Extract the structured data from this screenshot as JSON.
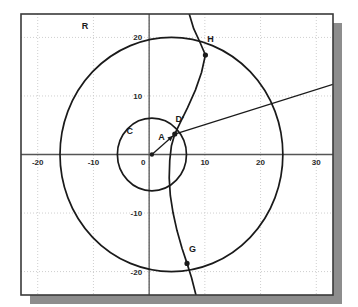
{
  "figure": {
    "background_color": "#ffffff",
    "frame_color": "#3a3a3a",
    "shadow_color": "#8d8d8d",
    "grid_color": "#cfcfcf",
    "axis_color": "#555555",
    "curve_color": "#1a1a1a"
  },
  "chart_data": {
    "type": "scatter",
    "title": "",
    "xlabel": "",
    "ylabel": "",
    "xlim": [
      -23,
      33
    ],
    "ylim": [
      -24,
      24
    ],
    "grid": true,
    "legend": "none",
    "x_ticks": [
      -20,
      -10,
      0,
      10,
      20,
      30
    ],
    "x_tick_labels": [
      "-20",
      "-10",
      "0",
      "10",
      "20",
      "30"
    ],
    "y_ticks": [
      20,
      10,
      -10,
      -20
    ],
    "y_tick_labels": [
      "20",
      "10",
      "-10",
      "-20"
    ],
    "origin_label": "0",
    "shapes": [
      {
        "name": "large-circle",
        "label": "R",
        "kind": "circle",
        "center": [
          4.0,
          0.0
        ],
        "radius": 20.0,
        "label_position": [
          -11.5,
          21.5
        ]
      },
      {
        "name": "small-circle",
        "label": "C",
        "kind": "circle",
        "center": [
          0.5,
          0.0
        ],
        "radius": 6.2,
        "label_position": [
          -3.5,
          3.5
        ]
      },
      {
        "name": "conic-curve",
        "kind": "curve",
        "through_labels": [
          "H",
          "D'",
          "G"
        ],
        "points": [
          [
            7.2,
            24.0
          ],
          [
            8.0,
            21.5
          ],
          [
            9.2,
            19.0
          ],
          [
            10.1,
            17.0
          ],
          [
            9.4,
            14.0
          ],
          [
            8.3,
            11.0
          ],
          [
            6.9,
            8.0
          ],
          [
            5.6,
            5.5
          ],
          [
            4.6,
            3.5
          ],
          [
            4.0,
            1.5
          ],
          [
            3.7,
            -1.0
          ],
          [
            3.6,
            -4.0
          ],
          [
            3.8,
            -7.0
          ],
          [
            4.3,
            -10.0
          ],
          [
            5.0,
            -13.0
          ],
          [
            5.9,
            -16.0
          ],
          [
            6.8,
            -18.6
          ],
          [
            7.6,
            -21.0
          ],
          [
            8.4,
            -24.0
          ]
        ]
      },
      {
        "name": "secant-line",
        "kind": "line",
        "from": [
          4.6,
          3.5
        ],
        "to": [
          33.0,
          12.0
        ]
      },
      {
        "name": "radius-arrow",
        "kind": "arrow",
        "label": "A",
        "from": [
          0.5,
          0.0
        ],
        "to": [
          4.3,
          3.2
        ],
        "label_position": [
          2.2,
          2.4
        ]
      }
    ],
    "points": [
      {
        "name": "point-H",
        "label": "H",
        "x": 10.1,
        "y": 17.0,
        "label_position": [
          11.0,
          19.3
        ]
      },
      {
        "name": "point-D-prime",
        "label": "D'",
        "x": 4.6,
        "y": 3.5,
        "label_position": [
          5.5,
          5.6
        ]
      },
      {
        "name": "point-G",
        "label": "G",
        "x": 6.8,
        "y": -18.6,
        "label_position": [
          7.8,
          -16.6
        ]
      },
      {
        "name": "point-origin",
        "label": "",
        "x": 0.5,
        "y": 0.0,
        "label_position": [
          0,
          0
        ]
      }
    ]
  }
}
